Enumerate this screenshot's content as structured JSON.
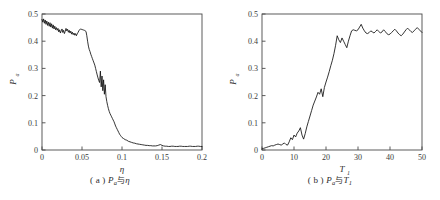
{
  "figure": {
    "background_color": "#ffffff",
    "curve_color": "#111111",
    "axis_color": "#4a4a4a"
  },
  "panel_a": {
    "caption_index": "( a )",
    "caption_symbol": "P",
    "caption_symbol_sub": "a",
    "caption_conjunction": "与",
    "caption_variable": "η",
    "y_axis_title": "P",
    "y_axis_title_sub": "a",
    "x_axis_title": "η",
    "x_ticks": [
      "0",
      "0.05",
      "0.1",
      "0.15",
      "0.2"
    ],
    "y_ticks": [
      "0",
      "0.1",
      "0.2",
      "0.3",
      "0.4",
      "0.5"
    ]
  },
  "panel_b": {
    "caption_index": "( b )",
    "caption_symbol": "P",
    "caption_symbol_sub": "a",
    "caption_conjunction": "与",
    "caption_variable": "T",
    "caption_variable_sub": "1",
    "y_axis_title": "P",
    "y_axis_title_sub": "a",
    "x_axis_title": "T",
    "x_axis_title_sub": "1",
    "x_ticks": [
      "0",
      "10",
      "20",
      "30",
      "40",
      "50"
    ],
    "y_ticks": [
      "0",
      "0.1",
      "0.2",
      "0.3",
      "0.4",
      "0.5"
    ]
  },
  "chart_data": [
    {
      "type": "line",
      "panel": "a",
      "title": "(a) Pa 与 η",
      "xlabel": "η",
      "ylabel": "Pa",
      "xlim": [
        0,
        0.2
      ],
      "ylim": [
        0,
        0.5
      ],
      "xticks": [
        0,
        0.05,
        0.1,
        0.15,
        0.2
      ],
      "yticks": [
        0,
        0.1,
        0.2,
        0.3,
        0.4,
        0.5
      ],
      "grid": false,
      "legend": null,
      "x": [
        0.0,
        0.001,
        0.002,
        0.003,
        0.004,
        0.005,
        0.006,
        0.007,
        0.008,
        0.009,
        0.01,
        0.011,
        0.012,
        0.013,
        0.014,
        0.015,
        0.016,
        0.017,
        0.018,
        0.019,
        0.02,
        0.021,
        0.022,
        0.023,
        0.024,
        0.025,
        0.026,
        0.027,
        0.028,
        0.029,
        0.03,
        0.031,
        0.032,
        0.033,
        0.034,
        0.035,
        0.036,
        0.037,
        0.038,
        0.039,
        0.04,
        0.041,
        0.042,
        0.043,
        0.044,
        0.045,
        0.046,
        0.047,
        0.048,
        0.049,
        0.05,
        0.051,
        0.052,
        0.053,
        0.054,
        0.055,
        0.056,
        0.057,
        0.058,
        0.059,
        0.06,
        0.061,
        0.062,
        0.063,
        0.064,
        0.065,
        0.066,
        0.067,
        0.068,
        0.069,
        0.07,
        0.071,
        0.072,
        0.073,
        0.074,
        0.075,
        0.076,
        0.077,
        0.078,
        0.079,
        0.08,
        0.081,
        0.082,
        0.083,
        0.084,
        0.085,
        0.086,
        0.087,
        0.088,
        0.089,
        0.09,
        0.091,
        0.092,
        0.093,
        0.094,
        0.095,
        0.096,
        0.097,
        0.098,
        0.099,
        0.1,
        0.102,
        0.104,
        0.106,
        0.108,
        0.11,
        0.112,
        0.114,
        0.116,
        0.118,
        0.12,
        0.122,
        0.124,
        0.126,
        0.128,
        0.13,
        0.132,
        0.134,
        0.136,
        0.138,
        0.14,
        0.142,
        0.144,
        0.146,
        0.148,
        0.15,
        0.152,
        0.154,
        0.156,
        0.158,
        0.16,
        0.162,
        0.164,
        0.166,
        0.168,
        0.17,
        0.172,
        0.174,
        0.176,
        0.178,
        0.18,
        0.182,
        0.184,
        0.186,
        0.188,
        0.19,
        0.192,
        0.194,
        0.196,
        0.198,
        0.2
      ],
      "y": [
        0.48,
        0.47,
        0.482,
        0.466,
        0.478,
        0.462,
        0.474,
        0.458,
        0.47,
        0.455,
        0.468,
        0.452,
        0.464,
        0.448,
        0.46,
        0.445,
        0.455,
        0.442,
        0.45,
        0.44,
        0.447,
        0.434,
        0.442,
        0.43,
        0.438,
        0.445,
        0.432,
        0.44,
        0.428,
        0.436,
        0.447,
        0.438,
        0.444,
        0.433,
        0.44,
        0.43,
        0.437,
        0.426,
        0.433,
        0.424,
        0.43,
        0.422,
        0.428,
        0.42,
        0.427,
        0.432,
        0.438,
        0.442,
        0.445,
        0.444,
        0.443,
        0.442,
        0.441,
        0.44,
        0.438,
        0.436,
        0.42,
        0.4,
        0.382,
        0.37,
        0.362,
        0.352,
        0.344,
        0.336,
        0.328,
        0.32,
        0.312,
        0.3,
        0.288,
        0.276,
        0.265,
        0.255,
        0.248,
        0.29,
        0.232,
        0.272,
        0.218,
        0.258,
        0.205,
        0.24,
        0.196,
        0.178,
        0.164,
        0.152,
        0.142,
        0.134,
        0.128,
        0.122,
        0.116,
        0.11,
        0.104,
        0.096,
        0.088,
        0.082,
        0.076,
        0.07,
        0.064,
        0.058,
        0.054,
        0.05,
        0.046,
        0.042,
        0.038,
        0.036,
        0.032,
        0.03,
        0.028,
        0.026,
        0.025,
        0.023,
        0.022,
        0.021,
        0.02,
        0.019,
        0.018,
        0.017,
        0.017,
        0.016,
        0.016,
        0.015,
        0.015,
        0.015,
        0.016,
        0.018,
        0.02,
        0.017,
        0.015,
        0.014,
        0.014,
        0.013,
        0.013,
        0.014,
        0.014,
        0.013,
        0.013,
        0.013,
        0.014,
        0.014,
        0.013,
        0.013,
        0.013,
        0.013,
        0.014,
        0.014,
        0.013,
        0.013,
        0.013,
        0.014,
        0.014,
        0.013,
        0.013
      ]
    },
    {
      "type": "line",
      "panel": "b",
      "title": "(b) Pa 与 T1",
      "xlabel": "T1",
      "ylabel": "Pa",
      "xlim": [
        0,
        50
      ],
      "ylim": [
        0,
        0.5
      ],
      "xticks": [
        0,
        10,
        20,
        30,
        40,
        50
      ],
      "yticks": [
        0,
        0.1,
        0.2,
        0.3,
        0.4,
        0.5
      ],
      "grid": false,
      "legend": null,
      "x": [
        0.0,
        0.5,
        1.0,
        1.5,
        2.0,
        2.5,
        3.0,
        3.5,
        4.0,
        4.5,
        5.0,
        5.5,
        6.0,
        6.5,
        7.0,
        7.5,
        8.0,
        8.5,
        9.0,
        9.5,
        10.0,
        10.5,
        11.0,
        11.5,
        12.0,
        12.5,
        13.0,
        13.5,
        14.0,
        14.5,
        15.0,
        15.5,
        16.0,
        16.5,
        17.0,
        17.5,
        18.0,
        18.5,
        19.0,
        19.5,
        20.0,
        20.5,
        21.0,
        21.5,
        22.0,
        22.5,
        23.0,
        23.5,
        24.0,
        24.5,
        25.0,
        25.5,
        26.0,
        26.5,
        27.0,
        27.5,
        28.0,
        28.5,
        29.0,
        29.5,
        30.0,
        30.5,
        31.0,
        31.5,
        32.0,
        32.5,
        33.0,
        33.5,
        34.0,
        34.5,
        35.0,
        35.5,
        36.0,
        36.5,
        37.0,
        37.5,
        38.0,
        38.5,
        39.0,
        39.5,
        40.0,
        40.5,
        41.0,
        41.5,
        42.0,
        42.5,
        43.0,
        43.5,
        44.0,
        44.5,
        45.0,
        45.5,
        46.0,
        46.5,
        47.0,
        47.5,
        48.0,
        48.5,
        49.0,
        49.5,
        50.0
      ],
      "y": [
        0.004,
        0.006,
        0.008,
        0.01,
        0.012,
        0.014,
        0.016,
        0.015,
        0.018,
        0.02,
        0.022,
        0.02,
        0.018,
        0.022,
        0.026,
        0.02,
        0.018,
        0.03,
        0.045,
        0.038,
        0.055,
        0.048,
        0.062,
        0.07,
        0.082,
        0.055,
        0.04,
        0.06,
        0.085,
        0.105,
        0.125,
        0.145,
        0.165,
        0.18,
        0.195,
        0.212,
        0.205,
        0.225,
        0.196,
        0.23,
        0.25,
        0.268,
        0.288,
        0.31,
        0.33,
        0.355,
        0.385,
        0.42,
        0.405,
        0.395,
        0.412,
        0.4,
        0.388,
        0.376,
        0.4,
        0.42,
        0.438,
        0.442,
        0.44,
        0.438,
        0.442,
        0.452,
        0.462,
        0.448,
        0.438,
        0.43,
        0.428,
        0.432,
        0.438,
        0.434,
        0.43,
        0.436,
        0.442,
        0.436,
        0.43,
        0.434,
        0.442,
        0.436,
        0.428,
        0.424,
        0.426,
        0.432,
        0.438,
        0.444,
        0.438,
        0.43,
        0.424,
        0.42,
        0.426,
        0.434,
        0.442,
        0.448,
        0.442,
        0.436,
        0.432,
        0.438,
        0.444,
        0.45,
        0.444,
        0.438,
        0.432
      ]
    }
  ]
}
